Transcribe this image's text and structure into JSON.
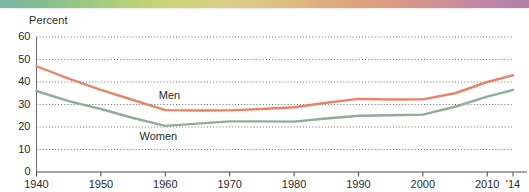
{
  "decor": {
    "top_band_name": "gradient-band",
    "colors": [
      "#7cb3a6",
      "#86bf8e",
      "#a9cc7e",
      "#c7d472",
      "#d9d089",
      "#dcc183",
      "#ddab7c",
      "#dd9a82",
      "#d08f95",
      "#bf85a6",
      "#b07fa8"
    ]
  },
  "chart_data": {
    "type": "line",
    "title": "",
    "subtitle": "",
    "xlabel": "",
    "ylabel": "Percent",
    "ylim": [
      0,
      60
    ],
    "xlim": [
      1940,
      2014
    ],
    "yticks": [
      0,
      10,
      20,
      30,
      40,
      50,
      60
    ],
    "ytick_labels": [
      "0",
      "10",
      "20",
      "30",
      "40",
      "50",
      "60"
    ],
    "xticks": [
      1940,
      1950,
      1960,
      1970,
      1980,
      1990,
      2000,
      2010,
      2014
    ],
    "xtick_labels": [
      "1940",
      "1950",
      "1960",
      "1970",
      "1980",
      "1990",
      "2000",
      "2010",
      "'14"
    ],
    "grid": "horizontal-dotted",
    "legend_position": "inline-annotations",
    "x": [
      1940,
      1945,
      1950,
      1955,
      1960,
      1965,
      1970,
      1975,
      1980,
      1985,
      1990,
      1995,
      2000,
      2005,
      2010,
      2014
    ],
    "series": [
      {
        "name": "Men",
        "color": "#e8836a",
        "label_x": 1959,
        "label_y": 34,
        "values": [
          47.0,
          41.5,
          36.5,
          32.0,
          27.5,
          27.3,
          27.4,
          28.0,
          28.8,
          30.8,
          32.5,
          32.2,
          32.3,
          35.0,
          40.0,
          43.0
        ]
      },
      {
        "name": "Women",
        "color": "#8fae97",
        "label_x": 1956,
        "label_y": 15.5,
        "values": [
          36.0,
          31.5,
          28.0,
          24.0,
          20.5,
          21.5,
          22.5,
          22.5,
          22.4,
          23.8,
          25.0,
          25.2,
          25.5,
          29.0,
          33.5,
          36.5
        ]
      }
    ]
  }
}
